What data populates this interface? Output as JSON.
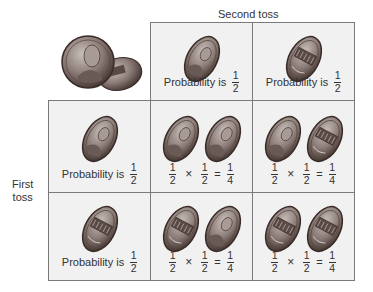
{
  "headers": {
    "top": "Second toss",
    "left_line1": "First",
    "left_line2": "toss"
  },
  "colors": {
    "cell_bg": "#f1f1f1",
    "border": "#7a7a7a",
    "coin_dark": "#4a3a35",
    "coin_mid": "#8a7a75",
    "coin_light": "#c8c0bc"
  },
  "column_headers": [
    {
      "coin": "heads",
      "text": "Probability is",
      "num": "1",
      "den": "2"
    },
    {
      "coin": "tails",
      "text": "Probability is",
      "num": "1",
      "den": "2"
    }
  ],
  "row_headers": [
    {
      "coin": "heads",
      "text": "Probability is",
      "num": "1",
      "den": "2"
    },
    {
      "coin": "tails",
      "text": "Probability is",
      "num": "1",
      "den": "2"
    }
  ],
  "cells": [
    {
      "coins": [
        "heads",
        "heads"
      ],
      "a_num": "1",
      "a_den": "2",
      "op": "×",
      "b_num": "1",
      "b_den": "2",
      "eq": "=",
      "r_num": "1",
      "r_den": "4"
    },
    {
      "coins": [
        "heads",
        "tails"
      ],
      "a_num": "1",
      "a_den": "2",
      "op": "×",
      "b_num": "1",
      "b_den": "2",
      "eq": "=",
      "r_num": "1",
      "r_den": "4"
    },
    {
      "coins": [
        "tails",
        "heads"
      ],
      "a_num": "1",
      "a_den": "2",
      "op": "×",
      "b_num": "1",
      "b_den": "2",
      "eq": "=",
      "r_num": "1",
      "r_den": "4"
    },
    {
      "coins": [
        "tails",
        "tails"
      ],
      "a_num": "1",
      "a_den": "2",
      "op": "×",
      "b_num": "1",
      "b_den": "2",
      "eq": "=",
      "r_num": "1",
      "r_den": "4"
    }
  ],
  "illustration": "two-pennies"
}
